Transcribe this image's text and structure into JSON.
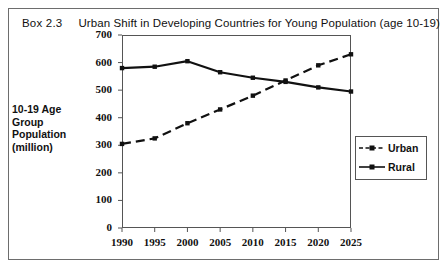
{
  "box": {
    "number": "Box 2.3",
    "title": "Urban Shift in Developing Countries for Young Population (age 10-19)"
  },
  "axis_title": {
    "line1": "10-19 Age",
    "line2": "Group",
    "line3": "Population",
    "line4": "(million)",
    "full": "10-19 Age Group Population (million)"
  },
  "legend": {
    "urban_label": "Urban",
    "rural_label": "Rural"
  },
  "colors": {
    "series": "#111111",
    "frame": "#555555",
    "outer_frame": "#6d6d6d",
    "background": "#ffffff"
  },
  "chart_data": {
    "type": "line",
    "title": "Urban Shift in Developing Countries for Young Population (age 10-19)",
    "xlabel": "",
    "ylabel": "10-19 Age Group Population (million)",
    "x": [
      1990,
      1995,
      2000,
      2005,
      2010,
      2015,
      2020,
      2025
    ],
    "categories": [
      "1990",
      "1995",
      "2000",
      "2005",
      "2010",
      "2015",
      "2020",
      "2025"
    ],
    "xlim": [
      1990,
      2025
    ],
    "ylim": [
      0,
      700
    ],
    "yticks": [
      0,
      100,
      200,
      300,
      400,
      500,
      600,
      700
    ],
    "ytick_labels": [
      "0",
      "100",
      "200",
      "300",
      "400",
      "500",
      "600",
      "700"
    ],
    "grid": false,
    "legend_position": "right",
    "series": [
      {
        "name": "Urban",
        "style": "dashed",
        "marker": "square",
        "values": [
          305,
          325,
          380,
          430,
          480,
          535,
          590,
          630
        ]
      },
      {
        "name": "Rural",
        "style": "solid",
        "marker": "square",
        "values": [
          580,
          585,
          605,
          565,
          545,
          530,
          510,
          495
        ]
      }
    ]
  }
}
